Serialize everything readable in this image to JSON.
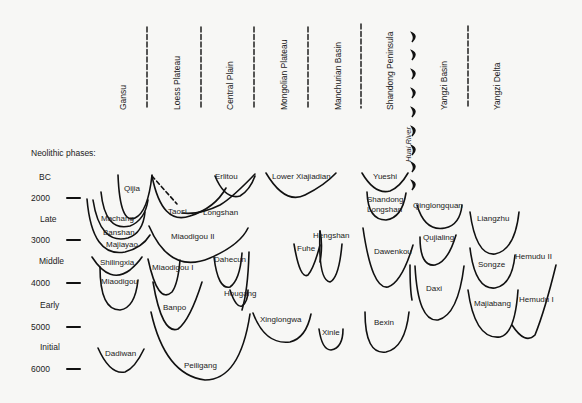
{
  "diagram": {
    "title": "Neolithic phases:",
    "regions": [
      {
        "label": "Gansu",
        "x": 118
      },
      {
        "label": "Loess Plateau",
        "x": 172
      },
      {
        "label": "Central Plain",
        "x": 225
      },
      {
        "label": "Mongolian Plateau",
        "x": 279
      },
      {
        "label": "Manchurian Basin",
        "x": 333
      },
      {
        "label": "Shandong Peninsula",
        "x": 386
      },
      {
        "label": "Yangzi Basin",
        "x": 440
      },
      {
        "label": "Yangzi Delta",
        "x": 493
      }
    ],
    "huai_river_label": "Huai River",
    "time_axis": {
      "era": "BC",
      "ticks": [
        {
          "label": "2000",
          "y": 198
        },
        {
          "label": "3000",
          "y": 240
        },
        {
          "label": "4000",
          "y": 283
        },
        {
          "label": "5000",
          "y": 327
        },
        {
          "label": "6000",
          "y": 369
        }
      ],
      "phases": [
        {
          "label": "Late",
          "y": 219
        },
        {
          "label": "Middle",
          "y": 261
        },
        {
          "label": "Early",
          "y": 305
        },
        {
          "label": "Initial",
          "y": 347
        }
      ]
    },
    "cultures": [
      {
        "label": "Qijia",
        "x": 124,
        "y": 188
      },
      {
        "label": "Machang",
        "x": 102,
        "y": 218
      },
      {
        "label": "Banshan",
        "x": 103,
        "y": 232
      },
      {
        "label": "Majiayao",
        "x": 107,
        "y": 244
      },
      {
        "label": "Shilingxia",
        "x": 101,
        "y": 262
      },
      {
        "label": "Miaodigou",
        "x": 102,
        "y": 281
      },
      {
        "label": "Dadiwan",
        "x": 106,
        "y": 353
      },
      {
        "label": "Taosi",
        "x": 168,
        "y": 211
      },
      {
        "label": "Longshan",
        "x": 203,
        "y": 212
      },
      {
        "label": "Miaodigou II",
        "x": 172,
        "y": 236
      },
      {
        "label": "Miaodigou I",
        "x": 153,
        "y": 267
      },
      {
        "label": "Banpo",
        "x": 163,
        "y": 307
      },
      {
        "label": "Peiligang",
        "x": 185,
        "y": 365
      },
      {
        "label": "Erlitou",
        "x": 215,
        "y": 176
      },
      {
        "label": "Dahecun",
        "x": 214,
        "y": 259
      },
      {
        "label": "Hougang",
        "x": 225,
        "y": 293
      },
      {
        "label": "Lower Xiajiadian",
        "x": 272,
        "y": 176
      },
      {
        "label": "Xinglongwa",
        "x": 261,
        "y": 319
      },
      {
        "label": "Fuhe",
        "x": 298,
        "y": 248
      },
      {
        "label": "Hengshan",
        "x": 314,
        "y": 235
      },
      {
        "label": "Xinle",
        "x": 322,
        "y": 332
      },
      {
        "label": "Yueshi",
        "x": 373,
        "y": 176
      },
      {
        "label": "Shandong",
        "x": 368,
        "y": 199
      },
      {
        "label": "Longshan",
        "x": 368,
        "y": 209
      },
      {
        "label": "Dawenkou",
        "x": 374,
        "y": 251
      },
      {
        "label": "Bexin",
        "x": 374,
        "y": 322
      },
      {
        "label": "Qinglongquan",
        "x": 413,
        "y": 205
      },
      {
        "label": "Qujialing",
        "x": 424,
        "y": 237
      },
      {
        "label": "Daxi",
        "x": 426,
        "y": 288
      },
      {
        "label": "Liangzhu",
        "x": 478,
        "y": 218
      },
      {
        "label": "Songze",
        "x": 479,
        "y": 264
      },
      {
        "label": "Hemudu II",
        "x": 516,
        "y": 256
      },
      {
        "label": "Majiabang",
        "x": 475,
        "y": 303
      },
      {
        "label": "Hemudu I",
        "x": 520,
        "y": 299
      }
    ]
  }
}
